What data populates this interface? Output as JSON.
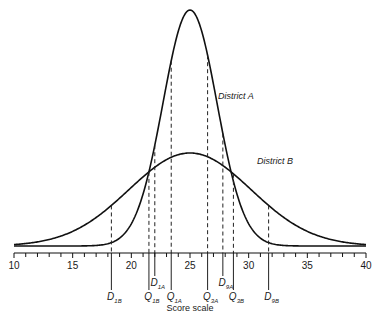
{
  "figure": {
    "axis_title": "Score scale",
    "x_min": 10,
    "x_max": 40,
    "tick_labels": [
      "10",
      "15",
      "20",
      "25",
      "30",
      "35",
      "40"
    ],
    "curves": [
      {
        "name": "District A",
        "label": "District A",
        "mean": 25,
        "sd": 2.3
      },
      {
        "name": "District B",
        "label": "District B",
        "mean": 25,
        "sd": 5.2
      }
    ],
    "markers": [
      {
        "id": "D1B",
        "main": "D",
        "sub": "1B",
        "value": 18.3,
        "row": "low"
      },
      {
        "id": "Q1B",
        "main": "Q",
        "sub": "1B",
        "value": 21.5,
        "row": "low"
      },
      {
        "id": "D1A",
        "main": "D",
        "sub": "1A",
        "value": 22.0,
        "row": "high"
      },
      {
        "id": "Q1A",
        "main": "Q",
        "sub": "1A",
        "value": 23.4,
        "row": "low"
      },
      {
        "id": "Q3A",
        "main": "Q",
        "sub": "3A",
        "value": 26.5,
        "row": "low"
      },
      {
        "id": "D9A",
        "main": "D",
        "sub": "9A",
        "value": 27.8,
        "row": "high"
      },
      {
        "id": "Q3B",
        "main": "Q",
        "sub": "3B",
        "value": 28.7,
        "row": "low"
      },
      {
        "id": "D9B",
        "main": "D",
        "sub": "9B",
        "value": 31.7,
        "row": "low"
      }
    ]
  },
  "chart_data": {
    "type": "line",
    "title": "",
    "xlabel": "Score scale",
    "ylabel": "",
    "xlim": [
      10,
      40
    ],
    "x_ticks": [
      10,
      15,
      20,
      25,
      30,
      35,
      40
    ],
    "grid": false,
    "series": [
      {
        "name": "District A",
        "distribution": "normal",
        "mean": 25,
        "approx_sd": 2.3
      },
      {
        "name": "District B",
        "distribution": "normal",
        "mean": 25,
        "approx_sd": 5.2
      }
    ],
    "annotations": [
      {
        "label": "D1B",
        "x": 18.3
      },
      {
        "label": "Q1B",
        "x": 21.5
      },
      {
        "label": "D1A",
        "x": 22.0
      },
      {
        "label": "Q1A",
        "x": 23.4
      },
      {
        "label": "Q3A",
        "x": 26.5
      },
      {
        "label": "D9A",
        "x": 27.8
      },
      {
        "label": "Q3B",
        "x": 28.7
      },
      {
        "label": "D9B",
        "x": 31.7
      }
    ]
  }
}
